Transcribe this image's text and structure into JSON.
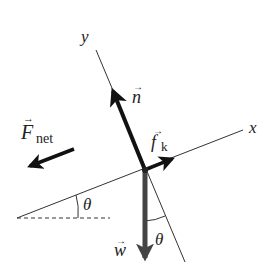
{
  "diagram": {
    "type": "free-body diagram on incline",
    "axes": {
      "x_label": "x",
      "y_label": "y"
    },
    "vectors": {
      "normal": {
        "symbol": "n",
        "arrow": "→"
      },
      "friction": {
        "symbol": "f",
        "subscript": "k",
        "arrow": "→"
      },
      "weight": {
        "symbol": "w",
        "arrow": "→"
      },
      "net_force": {
        "symbol": "F",
        "subscript": "net",
        "arrow": "→"
      }
    },
    "angles": {
      "incline_angle": "θ",
      "weight_angle": "θ"
    },
    "colors": {
      "line": "#222222",
      "weight_arrow": "#444444",
      "background": "#ffffff"
    }
  }
}
